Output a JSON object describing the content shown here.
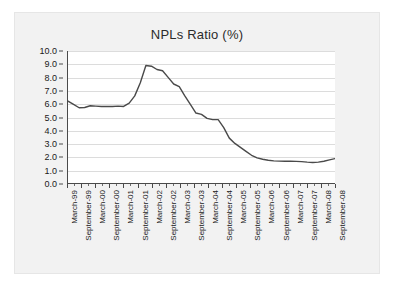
{
  "chart_data": {
    "type": "line",
    "title": "NPLs Ratio (%)",
    "xlabel": "",
    "ylabel": "",
    "ylim": [
      0.0,
      10.0
    ],
    "ytick_step": 1.0,
    "ytick_labels": [
      "0.0",
      "1.0",
      "2.0",
      "3.0",
      "4.0",
      "5.0",
      "6.0",
      "7.0",
      "8.0",
      "9.0",
      "10.0"
    ],
    "grid": true,
    "legend": "none",
    "line_color": "#4a4a4a",
    "categories": [
      "March-99",
      "September-99",
      "March-00",
      "September-00",
      "March-01",
      "September-01",
      "March-02",
      "September-02",
      "March-03",
      "September-03",
      "March-04",
      "September-04",
      "March-05",
      "September-05",
      "March-06",
      "September-06",
      "March-07",
      "September-07",
      "March-08",
      "September-08"
    ],
    "values": [
      6.2,
      5.7,
      5.85,
      5.8,
      5.8,
      6.6,
      8.9,
      8.5,
      7.3,
      5.3,
      4.8,
      3.0,
      2.4,
      1.9,
      1.7,
      1.65,
      1.65,
      1.55,
      1.65,
      1.85
    ],
    "series": [
      {
        "name": "NPLs Ratio (%)",
        "values": [
          6.2,
          5.7,
          5.85,
          5.8,
          5.8,
          6.6,
          8.9,
          8.5,
          7.3,
          5.3,
          4.8,
          3.0,
          2.4,
          1.9,
          1.7,
          1.65,
          1.65,
          1.55,
          1.65,
          1.85
        ]
      }
    ],
    "dense_points": [
      6.2,
      5.95,
      5.7,
      5.72,
      5.85,
      5.82,
      5.8,
      5.8,
      5.8,
      5.82,
      5.8,
      6.05,
      6.6,
      7.6,
      8.9,
      8.85,
      8.6,
      8.5,
      8.0,
      7.5,
      7.3,
      6.6,
      5.95,
      5.3,
      5.2,
      4.9,
      4.8,
      4.8,
      4.2,
      3.4,
      3.0,
      2.7,
      2.4,
      2.1,
      1.9,
      1.8,
      1.72,
      1.68,
      1.66,
      1.65,
      1.65,
      1.64,
      1.62,
      1.58,
      1.55,
      1.58,
      1.65,
      1.75,
      1.85
    ]
  },
  "figure": {
    "background_color": "#f2f2f2",
    "plot_background_color": "#ffffff",
    "gridline_color": "#dcdcdc",
    "axis_color": "#4a4a4a"
  }
}
